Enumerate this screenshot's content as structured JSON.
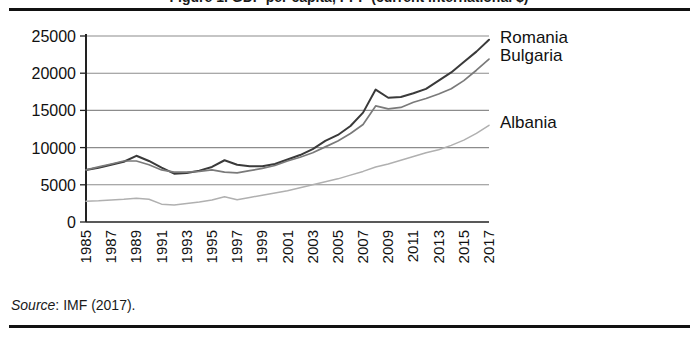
{
  "figure": {
    "partial_title": "Figure 1. GDP per capita, PPP (current international $)",
    "source_prefix": "Source",
    "source_text": ": IMF (2017)."
  },
  "chart_data": {
    "type": "line",
    "title": "",
    "xlabel": "",
    "ylabel": "",
    "ylim": [
      0,
      25000
    ],
    "ytick_step": 5000,
    "yticks": [
      "0",
      "5000",
      "10000",
      "15000",
      "20000",
      "25000"
    ],
    "grid": true,
    "legend_position": "right-inline",
    "x_tick_labels": [
      "1985",
      "1987",
      "1989",
      "1991",
      "1993",
      "1995",
      "1997",
      "1999",
      "2001",
      "2003",
      "2005",
      "2007",
      "2009",
      "2011",
      "2013",
      "2015",
      "2017"
    ],
    "x": [
      1985,
      1986,
      1987,
      1988,
      1989,
      1990,
      1991,
      1992,
      1993,
      1994,
      1995,
      1996,
      1997,
      1998,
      1999,
      2000,
      2001,
      2002,
      2003,
      2004,
      2005,
      2006,
      2007,
      2008,
      2009,
      2010,
      2011,
      2012,
      2013,
      2014,
      2015,
      2016,
      2017
    ],
    "series": [
      {
        "name": "Romania",
        "color": "#3a3a3a",
        "values": [
          7000,
          7300,
          7700,
          8100,
          8900,
          8200,
          7300,
          6500,
          6600,
          6900,
          7400,
          8300,
          7700,
          7500,
          7500,
          7800,
          8400,
          9000,
          9800,
          10900,
          11700,
          12900,
          14700,
          17800,
          16700,
          16800,
          17300,
          17900,
          19000,
          20100,
          21500,
          22900,
          24500
        ]
      },
      {
        "name": "Bulgaria",
        "color": "#7a7a7a",
        "values": [
          7000,
          7400,
          7800,
          8200,
          8200,
          7700,
          7000,
          6700,
          6700,
          6800,
          7000,
          6700,
          6600,
          6900,
          7200,
          7600,
          8200,
          8700,
          9300,
          10100,
          10900,
          11900,
          13100,
          15600,
          15200,
          15400,
          16100,
          16600,
          17200,
          17900,
          19000,
          20400,
          21900
        ]
      },
      {
        "name": "Albania",
        "color": "#b0b0b0",
        "values": [
          2800,
          2850,
          2950,
          3050,
          3200,
          3050,
          2400,
          2300,
          2500,
          2700,
          2950,
          3400,
          3000,
          3300,
          3600,
          3900,
          4200,
          4600,
          5000,
          5400,
          5800,
          6300,
          6800,
          7400,
          7800,
          8300,
          8800,
          9300,
          9700,
          10300,
          11000,
          11900,
          13000
        ]
      }
    ],
    "series_label_y": {
      "Romania": 24800,
      "Bulgaria": 22400,
      "Albania": 13400
    },
    "annotations": []
  }
}
